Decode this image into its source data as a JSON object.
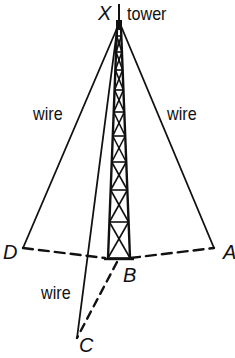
{
  "diagram": {
    "type": "geometry-figure",
    "colors": {
      "stroke": "#111111",
      "background": "#ffffff"
    },
    "labels": {
      "top_point": "X",
      "tower": "tower",
      "wire_left": "wire",
      "wire_right": "wire",
      "wire_bottom": "wire",
      "point_d": "D",
      "point_a": "A",
      "point_b": "B",
      "point_c": "C"
    },
    "points": {
      "X": [
        119,
        26
      ],
      "B": [
        119,
        258
      ],
      "D": [
        23,
        248
      ],
      "A": [
        214,
        248
      ],
      "C": [
        77,
        340
      ]
    },
    "segments": [
      {
        "from": "X",
        "to": "D",
        "style": "solid",
        "label": "wire"
      },
      {
        "from": "X",
        "to": "A",
        "style": "solid",
        "label": "wire"
      },
      {
        "from": "X",
        "to": "C",
        "style": "solid",
        "label": "wire"
      },
      {
        "from": "D",
        "to": "B",
        "style": "dashed"
      },
      {
        "from": "B",
        "to": "A",
        "style": "dashed"
      },
      {
        "from": "B",
        "to": "C",
        "style": "dashed"
      },
      {
        "from": "X",
        "to": "B",
        "style": "lattice-tower",
        "label": "tower"
      }
    ]
  }
}
